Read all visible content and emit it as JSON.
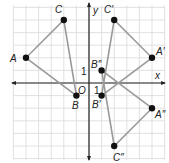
{
  "diagram": {
    "title": "",
    "grid": {
      "xmin": -6,
      "xmax": 6,
      "ymin": -6,
      "ymax": 6,
      "unit_px": 12.6,
      "origin_px": [
        89,
        83
      ]
    },
    "axes": {
      "x_label": "x",
      "y_label": "y",
      "origin_label": "O",
      "x_tick_label": "1",
      "y_tick_label": "1"
    },
    "colors": {
      "grid": "#d9d9d9",
      "axis": "#222222",
      "segment": "#9a9a9a",
      "point": "#111111"
    },
    "triangles": [
      {
        "name": "ABC",
        "points": [
          {
            "label": "A",
            "x": -5,
            "y": 2
          },
          {
            "label": "B",
            "x": -1,
            "y": -1
          },
          {
            "label": "C",
            "x": -2,
            "y": 5
          }
        ]
      },
      {
        "name": "A'B'C'",
        "points": [
          {
            "label": "A′",
            "x": 5,
            "y": 2
          },
          {
            "label": "B′",
            "x": 1,
            "y": -1
          },
          {
            "label": "C′",
            "x": 2,
            "y": 5
          }
        ]
      },
      {
        "name": "A''B''C''",
        "points": [
          {
            "label": "A″",
            "x": 5,
            "y": -2
          },
          {
            "label": "B″",
            "x": 1,
            "y": 1
          },
          {
            "label": "C″",
            "x": 2,
            "y": -5
          }
        ]
      }
    ]
  }
}
